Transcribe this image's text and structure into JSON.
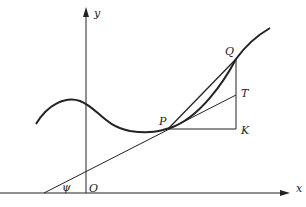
{
  "diagram": {
    "labels": {
      "y_axis": "y",
      "x_axis": "x",
      "origin": "O",
      "angle": "ψ",
      "point_p": "P",
      "point_q": "Q",
      "point_t": "T",
      "point_k": "K"
    },
    "colors": {
      "stroke": "#222222",
      "background": "#ffffff"
    }
  }
}
